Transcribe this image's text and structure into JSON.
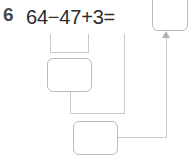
{
  "problem": {
    "number": "6",
    "equation": "64−47+3=",
    "operands": [
      64,
      47,
      3
    ],
    "operators": [
      "−",
      "+"
    ],
    "equals_sign": "="
  },
  "answer_boxes": [
    {
      "id": "final",
      "value": "",
      "placeholder": ""
    },
    {
      "id": "middle",
      "value": "",
      "placeholder": ""
    },
    {
      "id": "lower",
      "value": "",
      "placeholder": ""
    }
  ],
  "colors": {
    "box_border": "#b9bcc0",
    "connector": "#c8cacd",
    "arrow": "#b0b3b6",
    "number_text": "#4a4a4a",
    "equation_text": "#2b2b2b",
    "background": "#ffffff"
  },
  "icons": {
    "arrow_head": "arrow-up-icon"
  }
}
